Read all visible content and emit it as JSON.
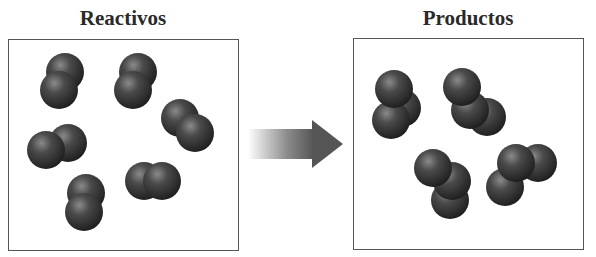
{
  "diagram": {
    "type": "reaction-scheme",
    "panels": [
      {
        "id": "reactants",
        "title": "Reactivos",
        "molecule_count": 6,
        "molecule_type": "diatomic",
        "molecules": [
          {
            "atoms": [
              [
                65,
                72
              ],
              [
                59,
                90
              ]
            ]
          },
          {
            "atoms": [
              [
                138,
                72
              ],
              [
                133,
                90
              ]
            ]
          },
          {
            "atoms": [
              [
                180,
                118
              ],
              [
                195,
                133
              ]
            ]
          },
          {
            "atoms": [
              [
                68,
                143
              ],
              [
                46,
                150
              ]
            ]
          },
          {
            "atoms": [
              [
                86,
                193
              ],
              [
                84,
                212
              ]
            ]
          },
          {
            "atoms": [
              [
                144,
                181
              ],
              [
                162,
                181
              ]
            ]
          }
        ]
      },
      {
        "id": "products",
        "title": "Productos",
        "molecule_count": 4,
        "molecule_type": "triatomic",
        "molecules": [
          {
            "atoms": [
              [
                402,
                108
              ],
              [
                391,
                120
              ],
              [
                394,
                89
              ]
            ]
          },
          {
            "atoms": [
              [
                487,
                117
              ],
              [
                470,
                110
              ],
              [
                462,
                87
              ]
            ]
          },
          {
            "atoms": [
              [
                450,
                200
              ],
              [
                452,
                181
              ],
              [
                433,
                168
              ]
            ]
          },
          {
            "atoms": [
              [
                538,
                163
              ],
              [
                505,
                187
              ],
              [
                516,
                163
              ]
            ]
          }
        ]
      }
    ],
    "arrow": {
      "direction": "right",
      "meaning": "reacts-to",
      "color": "#555555"
    },
    "colors": {
      "atom_dark": "#1e1e1e",
      "atom_mid": "#4a4a4a",
      "atom_highlight": "#8a8a8a",
      "border": "#555555"
    }
  }
}
